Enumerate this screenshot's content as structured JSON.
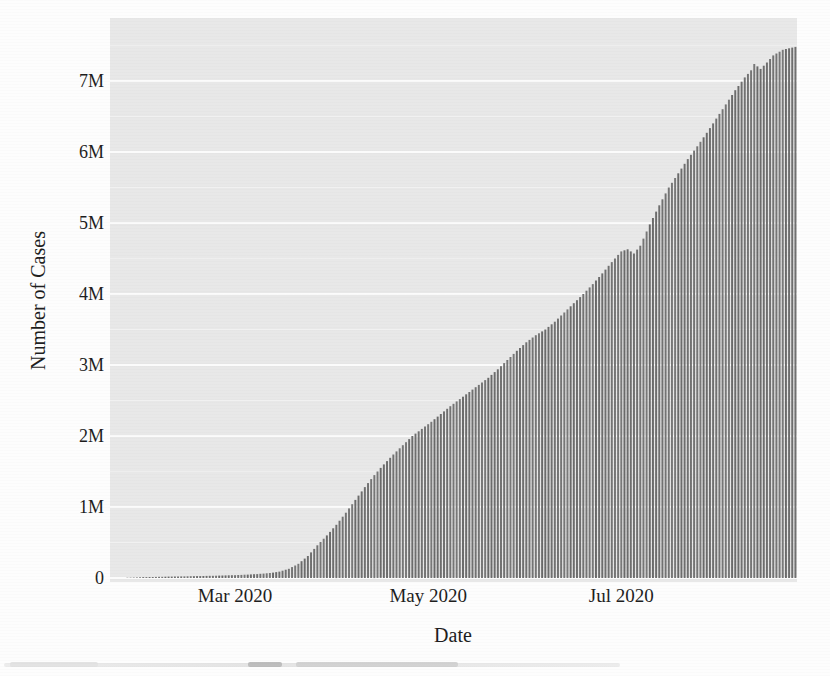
{
  "figure": {
    "kind": "scanned book figure",
    "x_axis_title": "Date",
    "y_axis_title": "Number of Cases"
  },
  "colors": {
    "page_background": "#fdfdfd",
    "panel_background": "#e8e8e8",
    "grid_major": "#fbfbfb",
    "grid_minor": "#f1f1f1",
    "bar": "#6f6f6f",
    "text": "#1c1c1c"
  },
  "chart_data": {
    "type": "bar",
    "title": "",
    "xlabel": "Date",
    "ylabel": "Number of Cases",
    "unit": "cases (millions)",
    "bar_frequency": "daily (one thin bar per day, cumulative totals)",
    "grid": "horizontal major gridlines at 1M steps, faint minor at 0.5M",
    "legend": "none",
    "x_start": "2020-01-22",
    "x_end": "2020-08-25",
    "ylim_millions": [
      0,
      7.9
    ],
    "y_ticks": [
      {
        "value_millions": 0,
        "label": "0"
      },
      {
        "value_millions": 1,
        "label": "1M"
      },
      {
        "value_millions": 2,
        "label": "2M"
      },
      {
        "value_millions": 3,
        "label": "3M"
      },
      {
        "value_millions": 4,
        "label": "4M"
      },
      {
        "value_millions": 5,
        "label": "5M"
      },
      {
        "value_millions": 6,
        "label": "6M"
      },
      {
        "value_millions": 7,
        "label": "7M"
      }
    ],
    "x_ticks": [
      {
        "date": "2020-03-01",
        "label": "Mar 2020"
      },
      {
        "date": "2020-05-01",
        "label": "May 2020"
      },
      {
        "date": "2020-07-01",
        "label": "Jul 2020"
      }
    ],
    "cumulative_points": [
      {
        "date": "2020-01-22",
        "cases_millions": 0.0
      },
      {
        "date": "2020-01-28",
        "cases_millions": 0.005
      },
      {
        "date": "2020-02-01",
        "cases_millions": 0.012
      },
      {
        "date": "2020-02-10",
        "cases_millions": 0.02
      },
      {
        "date": "2020-02-20",
        "cases_millions": 0.028
      },
      {
        "date": "2020-03-01",
        "cases_millions": 0.04
      },
      {
        "date": "2020-03-08",
        "cases_millions": 0.055
      },
      {
        "date": "2020-03-12",
        "cases_millions": 0.07
      },
      {
        "date": "2020-03-15",
        "cases_millions": 0.09
      },
      {
        "date": "2020-03-18",
        "cases_millions": 0.13
      },
      {
        "date": "2020-03-21",
        "cases_millions": 0.2
      },
      {
        "date": "2020-03-24",
        "cases_millions": 0.31
      },
      {
        "date": "2020-03-27",
        "cases_millions": 0.46
      },
      {
        "date": "2020-03-30",
        "cases_millions": 0.6
      },
      {
        "date": "2020-04-02",
        "cases_millions": 0.75
      },
      {
        "date": "2020-04-05",
        "cases_millions": 0.92
      },
      {
        "date": "2020-04-08",
        "cases_millions": 1.1
      },
      {
        "date": "2020-04-11",
        "cases_millions": 1.28
      },
      {
        "date": "2020-04-14",
        "cases_millions": 1.45
      },
      {
        "date": "2020-04-17",
        "cases_millions": 1.6
      },
      {
        "date": "2020-04-20",
        "cases_millions": 1.74
      },
      {
        "date": "2020-04-23",
        "cases_millions": 1.87
      },
      {
        "date": "2020-04-26",
        "cases_millions": 2.0
      },
      {
        "date": "2020-04-29",
        "cases_millions": 2.1
      },
      {
        "date": "2020-05-02",
        "cases_millions": 2.2
      },
      {
        "date": "2020-05-05",
        "cases_millions": 2.31
      },
      {
        "date": "2020-05-08",
        "cases_millions": 2.42
      },
      {
        "date": "2020-05-11",
        "cases_millions": 2.52
      },
      {
        "date": "2020-05-14",
        "cases_millions": 2.62
      },
      {
        "date": "2020-05-17",
        "cases_millions": 2.72
      },
      {
        "date": "2020-05-20",
        "cases_millions": 2.82
      },
      {
        "date": "2020-05-23",
        "cases_millions": 2.94
      },
      {
        "date": "2020-05-26",
        "cases_millions": 3.07
      },
      {
        "date": "2020-05-29",
        "cases_millions": 3.2
      },
      {
        "date": "2020-06-01",
        "cases_millions": 3.32
      },
      {
        "date": "2020-06-04",
        "cases_millions": 3.42
      },
      {
        "date": "2020-06-07",
        "cases_millions": 3.5
      },
      {
        "date": "2020-06-10",
        "cases_millions": 3.61
      },
      {
        "date": "2020-06-13",
        "cases_millions": 3.74
      },
      {
        "date": "2020-06-16",
        "cases_millions": 3.87
      },
      {
        "date": "2020-06-19",
        "cases_millions": 4.0
      },
      {
        "date": "2020-06-22",
        "cases_millions": 4.14
      },
      {
        "date": "2020-06-25",
        "cases_millions": 4.29
      },
      {
        "date": "2020-06-28",
        "cases_millions": 4.45
      },
      {
        "date": "2020-07-01",
        "cases_millions": 4.6
      },
      {
        "date": "2020-07-03",
        "cases_millions": 4.63
      },
      {
        "date": "2020-07-05",
        "cases_millions": 4.57
      },
      {
        "date": "2020-07-07",
        "cases_millions": 4.68
      },
      {
        "date": "2020-07-10",
        "cases_millions": 4.98
      },
      {
        "date": "2020-07-13",
        "cases_millions": 5.25
      },
      {
        "date": "2020-07-16",
        "cases_millions": 5.5
      },
      {
        "date": "2020-07-19",
        "cases_millions": 5.7
      },
      {
        "date": "2020-07-22",
        "cases_millions": 5.9
      },
      {
        "date": "2020-07-25",
        "cases_millions": 6.08
      },
      {
        "date": "2020-07-28",
        "cases_millions": 6.27
      },
      {
        "date": "2020-07-31",
        "cases_millions": 6.47
      },
      {
        "date": "2020-08-03",
        "cases_millions": 6.67
      },
      {
        "date": "2020-08-06",
        "cases_millions": 6.87
      },
      {
        "date": "2020-08-09",
        "cases_millions": 7.05
      },
      {
        "date": "2020-08-11",
        "cases_millions": 7.15
      },
      {
        "date": "2020-08-12",
        "cases_millions": 7.24
      },
      {
        "date": "2020-08-14",
        "cases_millions": 7.17
      },
      {
        "date": "2020-08-16",
        "cases_millions": 7.26
      },
      {
        "date": "2020-08-18",
        "cases_millions": 7.36
      },
      {
        "date": "2020-08-21",
        "cases_millions": 7.44
      },
      {
        "date": "2020-08-25",
        "cases_millions": 7.48
      }
    ]
  }
}
